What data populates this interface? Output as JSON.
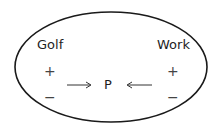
{
  "diagram": {
    "nodes": {
      "left_label": "Golf",
      "right_label": "Work",
      "center_label": "P"
    },
    "left_signs": {
      "plus": "+",
      "minus": "−"
    },
    "right_signs": {
      "plus": "+",
      "minus": "−"
    },
    "arrows": [
      {
        "from": "Golf",
        "to": "P",
        "direction": "right"
      },
      {
        "from": "Work",
        "to": "P",
        "direction": "left"
      }
    ],
    "colors": {
      "stroke": "#1a1a1a",
      "text": "#1e1e1e"
    }
  }
}
